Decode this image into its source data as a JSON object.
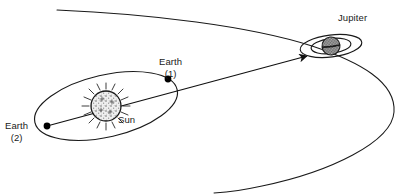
{
  "figure": {
    "domain": "diagram",
    "kind": "astronomy-trajectory-diagram",
    "background_color": "#ffffff",
    "stroke_color": "#1a1a1a",
    "width": 407,
    "height": 194
  },
  "labels": {
    "jupiter": "Jupiter",
    "earth_1": "Earth\n(1)",
    "earth_2": "Earth\n(2)",
    "sun": "Sun"
  },
  "bodies": {
    "sun": {
      "name": "Sun",
      "center_x": 106,
      "center_y": 106,
      "radius": 15,
      "fill": "#e6e6e6",
      "texture": "stippled",
      "rays": 16,
      "ray_length": 6
    },
    "jupiter": {
      "name": "Jupiter",
      "center_x": 331,
      "center_y": 46,
      "radius": 9,
      "fill": "#9a9a9a",
      "texture": "checker-stipple",
      "rings": [
        {
          "rx": 20,
          "ry": 7.5
        },
        {
          "rx": 31,
          "ry": 11
        }
      ],
      "ring_tilt_deg": -7
    }
  },
  "orbits": {
    "earth_orbit": {
      "name": "Earth orbit",
      "center_x": 106,
      "center_y": 106,
      "rx": 73,
      "ry": 31,
      "rotation_deg": -13
    }
  },
  "markers": [
    {
      "name": "earth-position-1",
      "label": "Earth (1)",
      "x": 168,
      "y": 79,
      "radius": 3.3,
      "fill": "#000000"
    },
    {
      "name": "earth-position-2",
      "label": "Earth (2)",
      "x": 47,
      "y": 126,
      "radius": 3.3,
      "fill": "#000000"
    }
  ],
  "paths": {
    "sight_line": {
      "name": "Earth-to-Jupiter sight line",
      "from_x": 47,
      "from_y": 126,
      "to_x": 309,
      "to_y": 55,
      "arrowhead": true,
      "arrow_angle_deg": -15
    },
    "trajectory": {
      "name": "Hyperbolic flyby trajectory",
      "description": "Large open curve sweeping in from upper left, around Jupiter, exiting lower left",
      "start_x": 57,
      "start_y": 10,
      "apex_x": 394,
      "apex_y": 112,
      "end_x": 214,
      "end_y": 193,
      "stroke_width": 1
    }
  }
}
